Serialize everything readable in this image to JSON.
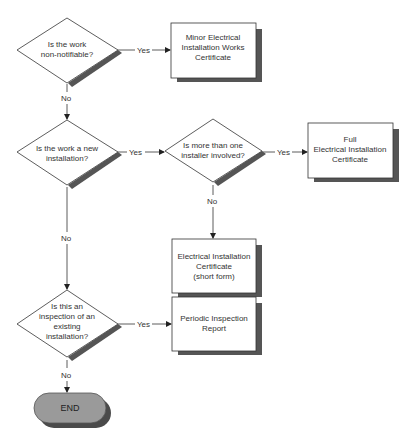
{
  "colors": {
    "line": "#333333",
    "shadow": "#555555",
    "node_fill": "#ffffff",
    "terminal_fill": "#9a9a9a",
    "terminal_shadow": "#4a4a4a"
  },
  "decisions": [
    {
      "id": "d1",
      "lines": [
        "Is the work",
        "non-notifiable?"
      ]
    },
    {
      "id": "d2",
      "lines": [
        "Is the work a new",
        "installation?"
      ]
    },
    {
      "id": "d3",
      "lines": [
        "Is more than one",
        "installer involved?"
      ]
    },
    {
      "id": "d4",
      "lines": [
        "Is this an",
        "inspection of an",
        "existing",
        "installation?"
      ]
    }
  ],
  "outcomes": [
    {
      "id": "o1",
      "lines": [
        "Minor Electrical",
        "Installation Works",
        "Certificate"
      ]
    },
    {
      "id": "o2",
      "lines": [
        "Full",
        "Electrical Installation",
        "Certificate"
      ]
    },
    {
      "id": "o3",
      "lines": [
        "Electrical Installation",
        "Certificate",
        "(short form)"
      ]
    },
    {
      "id": "o4",
      "lines": [
        "Periodic Inspection",
        "Report"
      ]
    }
  ],
  "terminal": {
    "label": "END"
  },
  "edges": [
    {
      "from": "d1",
      "to": "o1",
      "label": "Yes"
    },
    {
      "from": "d1",
      "to": "d2",
      "label": "No"
    },
    {
      "from": "d2",
      "to": "d3",
      "label": "Yes"
    },
    {
      "from": "d2",
      "to": "d4",
      "label": "No"
    },
    {
      "from": "d3",
      "to": "o2",
      "label": "Yes"
    },
    {
      "from": "d3",
      "to": "o3",
      "label": "No"
    },
    {
      "from": "d4",
      "to": "o4",
      "label": "Yes"
    },
    {
      "from": "d4",
      "to": "end",
      "label": "No"
    }
  ]
}
